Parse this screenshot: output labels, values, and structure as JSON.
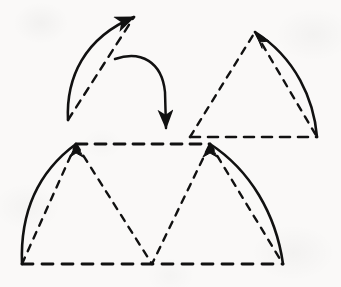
{
  "figure": {
    "kind": "geometry-diagram",
    "caption": "",
    "canvas": {
      "width": 341,
      "height": 287
    },
    "background_color": "#faf9f8",
    "ink_color": "#111111",
    "stroke_width_solid": 2.6,
    "stroke_width_dashed": 2.4,
    "dash_pattern_long": "9 7",
    "dash_pattern_short": "6 6",
    "shapes": [
      {
        "id": "top-left-lune",
        "label": "curved lune piece (detached)",
        "arc_solid": "M 68 120 C 66 78 84 38 134 17",
        "chord_dashed": "M 68 120 L 134 17",
        "arrowhead_at": {
          "x": 134,
          "y": 17
        },
        "arrowhead_angle_deg": -57
      },
      {
        "id": "top-right-triangle",
        "label": "curved triangle with dashed chords",
        "arc_solid": "M 255 32 C 296 58 314 100 317 137",
        "base_dashed": "M 190 137 L 317 137",
        "left_side_dashed": "M 190 137 L 255 32",
        "right_chord_dashed": "M 255 32 L 317 137",
        "arrowhead_at": {
          "x": 255,
          "y": 32
        },
        "arrowhead_angle_deg": -28
      },
      {
        "id": "bottom-dome",
        "label": "assembled dome of two curved triangles",
        "left_arc_solid": "M 22 264 C 20 213 38 172 76 144",
        "right_arc_solid": "M 210 144 C 250 170 276 214 283 264",
        "top_dashed": "M 76 144 L 210 144",
        "base_dashed": "M 22 264 L 283 264",
        "chord_left_dashed": "M 22 264 L 76 144",
        "chord_right_dashed": "M 210 144 L 283 264",
        "zigzag_dashed": "M 76 144 L 152 264 L 210 144",
        "arrowheads": [
          {
            "x": 76,
            "y": 144,
            "angle_deg": -72
          },
          {
            "x": 210,
            "y": 144,
            "angle_deg": -108
          }
        ]
      }
    ],
    "motion_arrow": {
      "id": "transform-arrow",
      "label": "curved arrow indicating the piece is moved down",
      "path": "M 115 59 C 141 50 162 62 165 92 L 166 128",
      "arrowhead_at": {
        "x": 166,
        "y": 137
      },
      "arrowhead_angle_deg": 90
    }
  }
}
